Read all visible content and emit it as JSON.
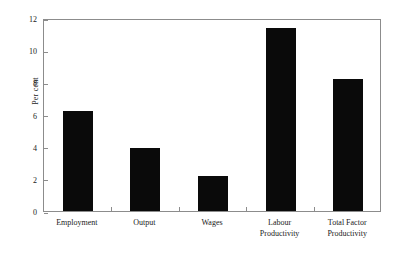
{
  "chart_data": {
    "type": "bar",
    "title": "",
    "xlabel": "",
    "ylabel": "Per cent",
    "categories": [
      "Employment",
      "Output",
      "Wages",
      "Labour Productivity",
      "Total Factor Productivity"
    ],
    "category_lines": [
      [
        "Employment",
        ""
      ],
      [
        "Output",
        ""
      ],
      [
        "Wages",
        ""
      ],
      [
        "Labour",
        "Productivity"
      ],
      [
        "Total Factor",
        "Productivity"
      ]
    ],
    "values": [
      6.2,
      3.9,
      2.2,
      11.4,
      8.2
    ],
    "ylim": [
      0,
      12
    ],
    "yticks": [
      0,
      2,
      4,
      6,
      8,
      10,
      12
    ],
    "ytick_labels": [
      "0",
      "2",
      "4",
      "6",
      "8",
      "10",
      "12"
    ],
    "grid": false,
    "legend": null,
    "bar_color": "#0a0a0a",
    "axis_color": "#8c8c8c",
    "background": "#ffffff"
  }
}
